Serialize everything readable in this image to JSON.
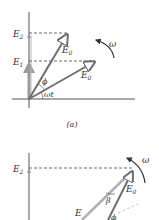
{
  "figure_a": {
    "caption": "(a)",
    "labels": {
      "E2": "E",
      "E2_sub": "2",
      "E1": "E",
      "E1_sub": "1",
      "E0_upper": "E",
      "E0_upper_sub": "0",
      "E0_lower": "E",
      "E0_lower_sub": "0",
      "phi": "ϕ",
      "omega_t": "ωt",
      "omega": "ω"
    }
  },
  "figure_b": {
    "labels": {
      "E2": "E",
      "E2_sub": "2",
      "E0": "E",
      "E0_sub": "0",
      "E": "E",
      "beta": "β",
      "phi": "ϕ",
      "omega": "ω"
    }
  },
  "colors": {
    "axis": "#555555",
    "phasor_dark": "#6e6e6e",
    "phasor_light": "#b0b0b0",
    "projection": "#9a9a9a",
    "dashed": "#444444"
  }
}
